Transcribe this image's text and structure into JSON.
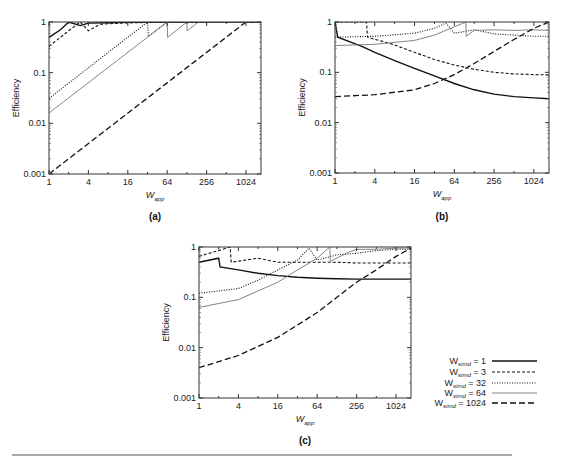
{
  "figure": {
    "rule_color": "#555555",
    "legend": {
      "entries": [
        {
          "prefix": "W",
          "sub": "simd",
          "text": "= 1",
          "style": "solid"
        },
        {
          "prefix": "W",
          "sub": "simd",
          "text": "= 3",
          "style": "dashed-short"
        },
        {
          "prefix": "W",
          "sub": "simd",
          "text": "= 32",
          "style": "dotted"
        },
        {
          "prefix": "W",
          "sub": "simd",
          "text": "= 64",
          "style": "thin-gray"
        },
        {
          "prefix": "W",
          "sub": "simd",
          "text": "= 1024",
          "style": "dashed-long"
        }
      ]
    }
  },
  "chart_data": [
    {
      "panel": "(a)",
      "type": "line",
      "xlabel": "W_app",
      "ylabel": "Efficiency",
      "xscale": "log2",
      "yscale": "log10",
      "xticks": [
        "1",
        "4",
        "16",
        "64",
        "256",
        "1024"
      ],
      "yticks": [
        "0.001",
        "0.01",
        "0.1",
        "1"
      ],
      "xlim": [
        1,
        1730
      ],
      "ylim": [
        0.001,
        1
      ],
      "series": [
        {
          "name": "W_simd = 1",
          "style": "solid",
          "x": [
            1,
            1.5,
            2,
            3,
            4,
            8,
            16,
            64,
            1730
          ],
          "y": [
            0.5,
            0.7,
            1.0,
            0.85,
            0.95,
            0.97,
            0.99,
            1.0,
            1.0
          ]
        },
        {
          "name": "W_simd = 3",
          "style": "dashed-short",
          "x": [
            1,
            2,
            3,
            4,
            6,
            12,
            32,
            1730
          ],
          "y": [
            0.33,
            0.67,
            1.0,
            0.67,
            0.9,
            0.95,
            0.98,
            1.0
          ]
        },
        {
          "name": "W_simd = 32",
          "style": "dotted",
          "x": [
            1,
            32,
            33,
            64,
            1730
          ],
          "y": [
            0.031,
            1.0,
            0.52,
            1.0,
            1.0
          ]
        },
        {
          "name": "W_simd = 64",
          "style": "thin-gray",
          "x": [
            1,
            64,
            65,
            128,
            129,
            192,
            1730
          ],
          "y": [
            0.016,
            1.0,
            0.5,
            1.0,
            0.67,
            1.0,
            1.0
          ]
        },
        {
          "name": "W_simd = 1024",
          "style": "dashed-long",
          "x": [
            1,
            1024,
            1730
          ],
          "y": [
            0.001,
            1.0,
            1.0
          ]
        }
      ]
    },
    {
      "panel": "(b)",
      "type": "line",
      "xlabel": "W_app",
      "ylabel": "Efficiency",
      "xscale": "log2",
      "yscale": "log10",
      "xticks": [
        "1",
        "4",
        "16",
        "64",
        "256",
        "1024"
      ],
      "yticks": [
        "0.001",
        "0.01",
        "0.1",
        "1"
      ],
      "xlim": [
        1,
        1730
      ],
      "ylim": [
        0.001,
        1
      ],
      "series": [
        {
          "name": "W_simd = 1",
          "style": "solid",
          "x": [
            1,
            1.1,
            2.5,
            4,
            8,
            16,
            32,
            64,
            128,
            256,
            512,
            1024,
            1730
          ],
          "y": [
            1.0,
            0.5,
            0.33,
            0.25,
            0.17,
            0.12,
            0.085,
            0.06,
            0.045,
            0.037,
            0.033,
            0.031,
            0.03
          ]
        },
        {
          "name": "W_simd = 3",
          "style": "dashed-short",
          "x": [
            1,
            3,
            3.1,
            8,
            16,
            32,
            64,
            128,
            256,
            512,
            1024,
            1730
          ],
          "y": [
            1.0,
            1.0,
            0.5,
            0.35,
            0.25,
            0.18,
            0.14,
            0.115,
            0.1,
            0.093,
            0.09,
            0.089
          ]
        },
        {
          "name": "W_simd = 32",
          "style": "dotted",
          "x": [
            1,
            4,
            16,
            32,
            48,
            64,
            128,
            256,
            512,
            1024,
            1730
          ],
          "y": [
            0.5,
            0.52,
            0.6,
            0.75,
            0.95,
            0.6,
            0.7,
            0.58,
            0.55,
            0.52,
            0.52
          ]
        },
        {
          "name": "W_simd = 64",
          "style": "thin-gray",
          "x": [
            1,
            4,
            16,
            32,
            64,
            96,
            97,
            128,
            256,
            512,
            1024,
            1730
          ],
          "y": [
            0.34,
            0.36,
            0.43,
            0.55,
            0.8,
            1.0,
            0.52,
            0.68,
            0.7,
            0.68,
            0.7,
            0.68
          ]
        },
        {
          "name": "W_simd = 1024",
          "style": "dashed-long",
          "x": [
            1,
            4,
            16,
            32,
            64,
            128,
            256,
            512,
            1024,
            1730
          ],
          "y": [
            0.033,
            0.036,
            0.045,
            0.06,
            0.09,
            0.15,
            0.26,
            0.45,
            0.75,
            1.0
          ]
        }
      ]
    },
    {
      "panel": "(c)",
      "type": "line",
      "xlabel": "W_app",
      "ylabel": "Efficiency",
      "xscale": "log2",
      "yscale": "log10",
      "xticks": [
        "1",
        "4",
        "16",
        "64",
        "256",
        "1024"
      ],
      "yticks": [
        "0.001",
        "0.01",
        "0.1",
        "1"
      ],
      "xlim": [
        1,
        1730
      ],
      "ylim": [
        0.001,
        1
      ],
      "series": [
        {
          "name": "W_simd = 1",
          "style": "solid",
          "x": [
            1,
            2,
            2.1,
            4,
            8,
            16,
            32,
            64,
            128,
            256,
            512,
            1024,
            1730
          ],
          "y": [
            0.5,
            0.6,
            0.4,
            0.35,
            0.3,
            0.27,
            0.25,
            0.24,
            0.235,
            0.23,
            0.23,
            0.23,
            0.23
          ]
        },
        {
          "name": "W_simd = 3",
          "style": "dashed-short",
          "x": [
            1,
            3,
            3.1,
            8,
            16,
            32,
            48,
            64,
            128,
            256,
            512,
            1024,
            1730
          ],
          "y": [
            0.65,
            1.0,
            0.5,
            0.6,
            0.5,
            0.5,
            0.5,
            0.5,
            0.5,
            0.48,
            0.48,
            0.48,
            0.48
          ]
        },
        {
          "name": "W_simd = 32",
          "style": "dotted",
          "x": [
            1,
            4,
            8,
            16,
            32,
            48,
            64,
            128,
            256,
            512,
            1024,
            1730
          ],
          "y": [
            0.12,
            0.15,
            0.22,
            0.35,
            0.55,
            0.95,
            0.55,
            0.7,
            0.75,
            0.85,
            0.9,
            0.9
          ]
        },
        {
          "name": "W_simd = 64",
          "style": "thin-gray",
          "x": [
            1,
            4,
            16,
            32,
            64,
            100,
            101,
            200,
            256,
            512,
            1024,
            1730
          ],
          "y": [
            0.063,
            0.09,
            0.2,
            0.35,
            0.6,
            1.0,
            0.52,
            0.8,
            0.9,
            0.9,
            0.95,
            0.95
          ]
        },
        {
          "name": "W_simd = 1024",
          "style": "dashed-long",
          "x": [
            1,
            4,
            16,
            64,
            128,
            256,
            512,
            1024,
            1730
          ],
          "y": [
            0.004,
            0.007,
            0.016,
            0.05,
            0.1,
            0.2,
            0.35,
            0.65,
            0.95
          ]
        }
      ]
    }
  ],
  "panels": {
    "a": {
      "label": "(a)",
      "ylabel": "Efficiency",
      "xlabel_main": "W",
      "xlabel_sub": "app"
    },
    "b": {
      "label": "(b)",
      "ylabel": "Efficiency",
      "xlabel_main": "W",
      "xlabel_sub": "app"
    },
    "c": {
      "label": "(c)",
      "ylabel": "Efficiency",
      "xlabel_main": "W",
      "xlabel_sub": "app"
    }
  }
}
